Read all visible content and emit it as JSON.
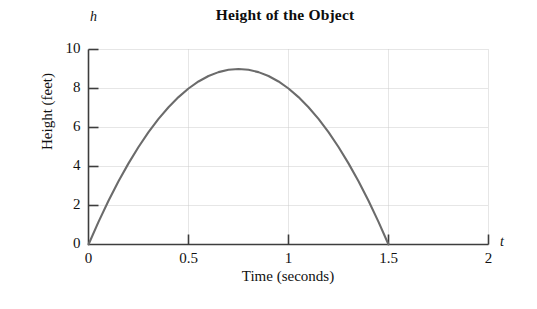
{
  "chart": {
    "title": "Height of the Object",
    "y_var_symbol": "h",
    "x_var_symbol": "t",
    "y_axis_title": "Height (feet)",
    "x_axis_title": "Time (seconds)"
  },
  "chart_data": {
    "type": "line",
    "title": "Height of the Object",
    "xlabel": "Time (seconds)",
    "ylabel": "Height (feet)",
    "x_symbol": "t",
    "y_symbol": "h",
    "xlim": [
      0,
      2
    ],
    "ylim": [
      0,
      10
    ],
    "xticks": [
      0,
      0.5,
      1,
      1.5,
      2
    ],
    "xtick_labels": [
      "0",
      "0.5",
      "1",
      "1.5",
      "2"
    ],
    "yticks": [
      0,
      2,
      4,
      6,
      8,
      10
    ],
    "ytick_labels": [
      "0",
      "2",
      "4",
      "6",
      "8",
      "10"
    ],
    "grid": true,
    "grid_color": "#cccccc",
    "legend": "none",
    "curve_color": "#6b6b6b",
    "curve_width": 2.1,
    "equation": "h = -16t^2 + 24t",
    "vertex": {
      "t": 0.75,
      "h": 9
    },
    "zeros": [
      0,
      1.5
    ],
    "series": [
      {
        "name": "Height of the object",
        "x": [
          0,
          0.05,
          0.1,
          0.15,
          0.2,
          0.25,
          0.3,
          0.35,
          0.4,
          0.45,
          0.5,
          0.55,
          0.6,
          0.65,
          0.7,
          0.75,
          0.8,
          0.85,
          0.9,
          0.95,
          1,
          1.05,
          1.1,
          1.15,
          1.2,
          1.25,
          1.3,
          1.35,
          1.4,
          1.45,
          1.5
        ],
        "values": [
          0,
          1.16,
          2.24,
          3.24,
          4.16,
          5,
          5.76,
          6.44,
          7.04,
          7.56,
          8,
          8.36,
          8.64,
          8.84,
          8.96,
          9,
          8.96,
          8.84,
          8.64,
          8.36,
          8,
          7.56,
          7.04,
          6.44,
          5.76,
          5,
          4.16,
          3.24,
          2.24,
          1.16,
          0
        ]
      }
    ]
  }
}
